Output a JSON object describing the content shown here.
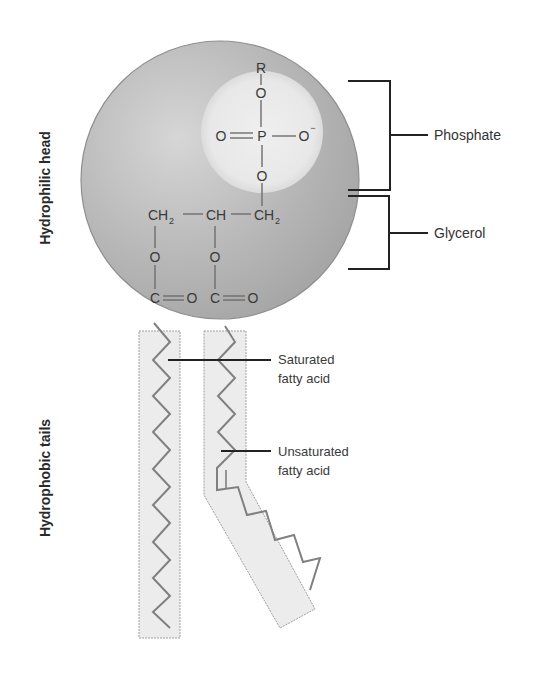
{
  "colors": {
    "head_light": "#d4d4d4",
    "head_dark": "#a6a6a6",
    "phosphate_region": "#ececec",
    "tail_fill": "#ececec",
    "tail_stroke": "#9a9a9a",
    "chain_stroke": "#7d7d7d",
    "bracket": "#222222",
    "text": "#333333"
  },
  "side_labels": {
    "head": "Hydrophilic head",
    "tails": "Hydrophobic tails"
  },
  "brackets": {
    "phosphate": "Phosphate",
    "glycerol": "Glycerol"
  },
  "tail_labels": {
    "saturated_line1": "Saturated",
    "saturated_line2": "fatty acid",
    "unsaturated_line1": "Unsaturated",
    "unsaturated_line2": "fatty acid"
  },
  "chemistry": {
    "r_group": "R",
    "o_top": "O",
    "o_double": "O",
    "p": "P",
    "o_minus": "O",
    "minus": "−",
    "o_bottom": "O",
    "ch2_left": "CH",
    "ch2_left_sub": "2",
    "ch_mid": "CH",
    "ch2_right": "CH",
    "ch2_right_sub": "2",
    "o_ester_left": "O",
    "o_ester_mid": "O",
    "c_left": "C",
    "o_carbonyl_left": "O",
    "c_mid": "C",
    "o_carbonyl_mid": "O"
  }
}
